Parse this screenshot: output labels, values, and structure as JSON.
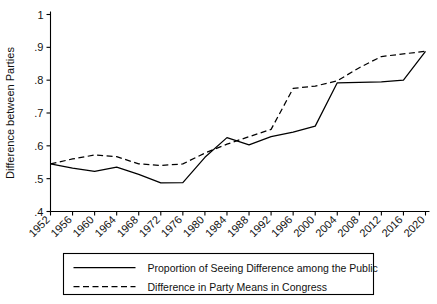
{
  "chart_data": {
    "type": "line",
    "title": "",
    "subtitle": "",
    "xlabel": "",
    "ylabel": "Difference between Parties",
    "xlim": [
      1952,
      2020
    ],
    "ylim": [
      0.4,
      1.0
    ],
    "yticks": [
      ".4",
      ".5",
      ".6",
      ".7",
      ".8",
      ".9",
      "1"
    ],
    "ytick_values": [
      0.4,
      0.5,
      0.6,
      0.7,
      0.8,
      0.9,
      1.0
    ],
    "grid": false,
    "legend_position": "below",
    "x": [
      1952,
      1956,
      1960,
      1964,
      1968,
      1972,
      1976,
      1980,
      1984,
      1988,
      1992,
      1996,
      2000,
      2004,
      2008,
      2012,
      2016,
      2020
    ],
    "categories": [
      "1952",
      "1956",
      "1960",
      "1964",
      "1968",
      "1972",
      "1976",
      "1980",
      "1984",
      "1988",
      "1992",
      "1996",
      "2000",
      "2004",
      "2008",
      "2012",
      "2016",
      "2020"
    ],
    "series": [
      {
        "name": "Proportion of Seeing Difference among the Public",
        "style": "solid",
        "color": "#000000",
        "values": [
          0.545,
          0.532,
          0.522,
          0.535,
          0.513,
          0.487,
          0.488,
          0.565,
          0.625,
          0.603,
          0.628,
          0.642,
          0.66,
          0.792,
          0.793,
          0.795,
          0.8,
          0.888
        ]
      },
      {
        "name": "Difference in Party Means in Congress",
        "style": "dashed",
        "color": "#000000",
        "values": [
          0.545,
          0.56,
          0.572,
          0.567,
          0.545,
          0.54,
          0.545,
          0.578,
          0.605,
          0.628,
          0.65,
          0.775,
          0.782,
          0.798,
          0.838,
          0.872,
          0.88,
          0.888
        ]
      }
    ]
  },
  "legend": {
    "items": [
      {
        "label": "Proportion of Seeing Difference among the Public",
        "style": "solid"
      },
      {
        "label": "Difference in Party Means in Congress",
        "style": "dashed"
      }
    ]
  },
  "axes": {
    "y_title": "Difference between Parties"
  }
}
